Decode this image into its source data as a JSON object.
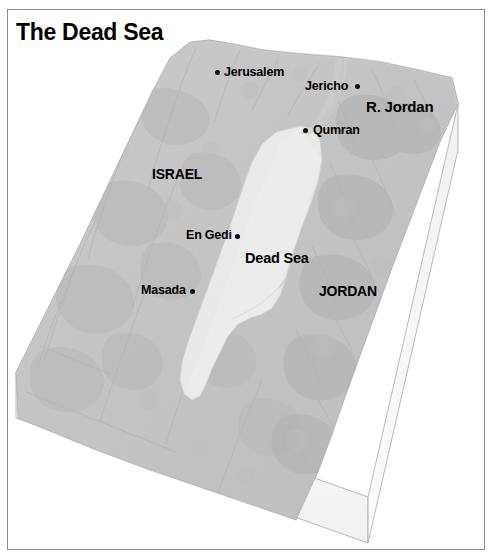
{
  "figure": {
    "title": "The Dead Sea",
    "type": "3d-block-relief-map",
    "frame_color": "#8d8d8d",
    "background_color": "#ffffff"
  },
  "palette": {
    "terrain_fill": "#c3c3c3",
    "terrain_fill_light": "#cccccc",
    "terrain_shadow": "#b4b4b4",
    "water_fill": "#e9e9e9",
    "block_side_fill": "#f7f7f7",
    "block_side_fill_dark": "#efefef",
    "outline": "#9a9a9a",
    "label_color": "#000000"
  },
  "map": {
    "title_label": "The Dead Sea",
    "cities": [
      {
        "name": "Jerusalem",
        "label": "Jerusalem",
        "dot_x": 217,
        "dot_y": 72,
        "text_x": 224,
        "text_y": 66,
        "dot_side": "left"
      },
      {
        "name": "Jericho",
        "label": "Jericho",
        "dot_x": 357,
        "dot_y": 86,
        "text_x": 306,
        "text_y": 80,
        "dot_side": "right"
      },
      {
        "name": "Qumran",
        "label": "Qumran",
        "dot_x": 305,
        "dot_y": 130,
        "text_x": 313,
        "text_y": 124,
        "dot_side": "left"
      },
      {
        "name": "En Gedi",
        "label": "En Gedi",
        "dot_x": 237,
        "dot_y": 236,
        "text_x": 187,
        "text_y": 229,
        "dot_side": "right"
      },
      {
        "name": "Masada",
        "label": "Masada",
        "dot_x": 192,
        "dot_y": 291,
        "text_x": 142,
        "text_y": 284,
        "dot_side": "right"
      }
    ],
    "regions": [
      {
        "name": "israel",
        "label": "ISRAEL",
        "x": 152,
        "y": 167
      },
      {
        "name": "jordan",
        "label": "JORDAN",
        "x": 319,
        "y": 284
      }
    ],
    "water_bodies": [
      {
        "name": "dead-sea",
        "label": "Dead Sea",
        "x": 245,
        "y": 251
      }
    ],
    "rivers": [
      {
        "name": "jordan-river",
        "label": "R. Jordan",
        "x": 366,
        "y": 99
      }
    ]
  }
}
